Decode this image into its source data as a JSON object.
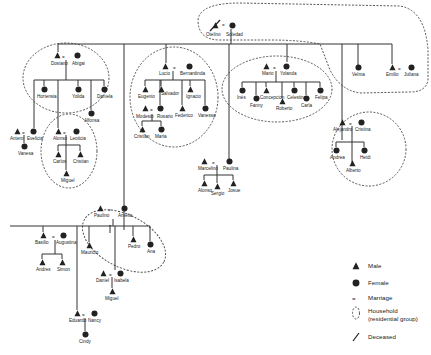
{
  "diagram": {
    "type": "kinship-chart",
    "founders": {
      "husband": "Otelino",
      "wife": "Soledad",
      "husband_deceased": true
    },
    "people": [
      {
        "id": "otelino",
        "name": "Otelino",
        "sex": "male",
        "deceased": true
      },
      {
        "id": "soledad",
        "name": "Soledad",
        "sex": "female"
      },
      {
        "id": "dosiano",
        "name": "Dosiano",
        "sex": "male"
      },
      {
        "id": "abigai",
        "name": "Abigai",
        "sex": "female"
      },
      {
        "id": "hortensia",
        "name": "Hortensia",
        "sex": "female"
      },
      {
        "id": "yolanda_d",
        "name": "Yolida",
        "sex": "female"
      },
      {
        "id": "alfonsa",
        "name": "Alfonsa",
        "sex": "female"
      },
      {
        "id": "daniela",
        "name": "Daniela",
        "sex": "female"
      },
      {
        "id": "antero",
        "name": "Antero",
        "sex": "male"
      },
      {
        "id": "evelicia",
        "name": "Evelicia",
        "sex": "female"
      },
      {
        "id": "vanessa_a",
        "name": "Vanesa",
        "sex": "female"
      },
      {
        "id": "alonso",
        "name": "Alonso",
        "sex": "male"
      },
      {
        "id": "leoticia",
        "name": "Leoticia",
        "sex": "female"
      },
      {
        "id": "carlos",
        "name": "Carlos",
        "sex": "male"
      },
      {
        "id": "cristian_a",
        "name": "Cristian",
        "sex": "male"
      },
      {
        "id": "miguel_a",
        "name": "Miguel",
        "sex": "male"
      },
      {
        "id": "lucio",
        "name": "Lucio",
        "sex": "male"
      },
      {
        "id": "bernardinda",
        "name": "Bernardinda",
        "sex": "female"
      },
      {
        "id": "eugenio",
        "name": "Eugenio",
        "sex": "male"
      },
      {
        "id": "salvador",
        "name": "Salvador",
        "sex": "male"
      },
      {
        "id": "ignacio",
        "name": "Ignacio",
        "sex": "male"
      },
      {
        "id": "modesto",
        "name": "Modesto",
        "sex": "male"
      },
      {
        "id": "rosario",
        "name": "Rosario",
        "sex": "female"
      },
      {
        "id": "federico",
        "name": "Federico",
        "sex": "male"
      },
      {
        "id": "vanessa",
        "name": "Vanessa",
        "sex": "female"
      },
      {
        "id": "cristian",
        "name": "Cristian",
        "sex": "male"
      },
      {
        "id": "maria",
        "name": "Maria",
        "sex": "female"
      },
      {
        "id": "mario",
        "name": "Mario",
        "sex": "male"
      },
      {
        "id": "yolanda",
        "name": "Yolanda",
        "sex": "female"
      },
      {
        "id": "inés",
        "name": "Inés",
        "sex": "female"
      },
      {
        "id": "fanny",
        "name": "Fanny",
        "sex": "female"
      },
      {
        "id": "concepcion",
        "name": "Concepcion",
        "sex": "male"
      },
      {
        "id": "roberto",
        "name": "Roberto",
        "sex": "male"
      },
      {
        "id": "celestina",
        "name": "Celestina",
        "sex": "female"
      },
      {
        "id": "carla",
        "name": "Carla",
        "sex": "female"
      },
      {
        "id": "felipa",
        "name": "Felipa",
        "sex": "female"
      },
      {
        "id": "velma",
        "name": "Velma",
        "sex": "female"
      },
      {
        "id": "emilio",
        "name": "Emilio",
        "sex": "male"
      },
      {
        "id": "juliana",
        "name": "Juliana",
        "sex": "female"
      },
      {
        "id": "alejandro",
        "name": "Alejandro",
        "sex": "male"
      },
      {
        "id": "cristina",
        "name": "Cristina",
        "sex": "female"
      },
      {
        "id": "andrea",
        "name": "Andrea",
        "sex": "female"
      },
      {
        "id": "heidi",
        "name": "Heidi",
        "sex": "female"
      },
      {
        "id": "alberto",
        "name": "Alberto",
        "sex": "male"
      },
      {
        "id": "marcelino",
        "name": "Marcelino",
        "sex": "male"
      },
      {
        "id": "paulina",
        "name": "Paulina",
        "sex": "female"
      },
      {
        "id": "alonso2",
        "name": "Alonso",
        "sex": "male"
      },
      {
        "id": "sergio",
        "name": "Sergio",
        "sex": "male"
      },
      {
        "id": "josue",
        "name": "Josue",
        "sex": "male"
      },
      {
        "id": "paulino",
        "name": "Paulino",
        "sex": "male"
      },
      {
        "id": "amelia",
        "name": "Amelia",
        "sex": "female"
      },
      {
        "id": "pedro",
        "name": "Pedro",
        "sex": "male"
      },
      {
        "id": "ana",
        "name": "Ana",
        "sex": "female"
      },
      {
        "id": "basilio",
        "name": "Basilio",
        "sex": "male"
      },
      {
        "id": "augustina",
        "name": "Augustina",
        "sex": "female"
      },
      {
        "id": "andres",
        "name": "Andres",
        "sex": "male"
      },
      {
        "id": "simon",
        "name": "Simon",
        "sex": "male"
      },
      {
        "id": "mauricio",
        "name": "Mauricio",
        "sex": "male"
      },
      {
        "id": "daniel",
        "name": "Daniel",
        "sex": "male"
      },
      {
        "id": "isabela",
        "name": "Isabela",
        "sex": "female"
      },
      {
        "id": "miguel",
        "name": "Miguel",
        "sex": "male"
      },
      {
        "id": "eduardo",
        "name": "Eduardo",
        "sex": "male"
      },
      {
        "id": "nancy",
        "name": "Nancy",
        "sex": "female"
      },
      {
        "id": "cindy",
        "name": "Cindy",
        "sex": "female"
      }
    ]
  },
  "legend": {
    "items": [
      {
        "symbol": "triangle",
        "label": "Male"
      },
      {
        "symbol": "circle",
        "label": "Female"
      },
      {
        "symbol": "equals",
        "label": "Marriage"
      },
      {
        "symbol": "dashed-circle",
        "label": "Household",
        "sublabel": "(residential group)"
      },
      {
        "symbol": "slash",
        "label": "Deceased"
      }
    ]
  },
  "colors": {
    "ink": "#222222",
    "background": "#ffffff"
  }
}
